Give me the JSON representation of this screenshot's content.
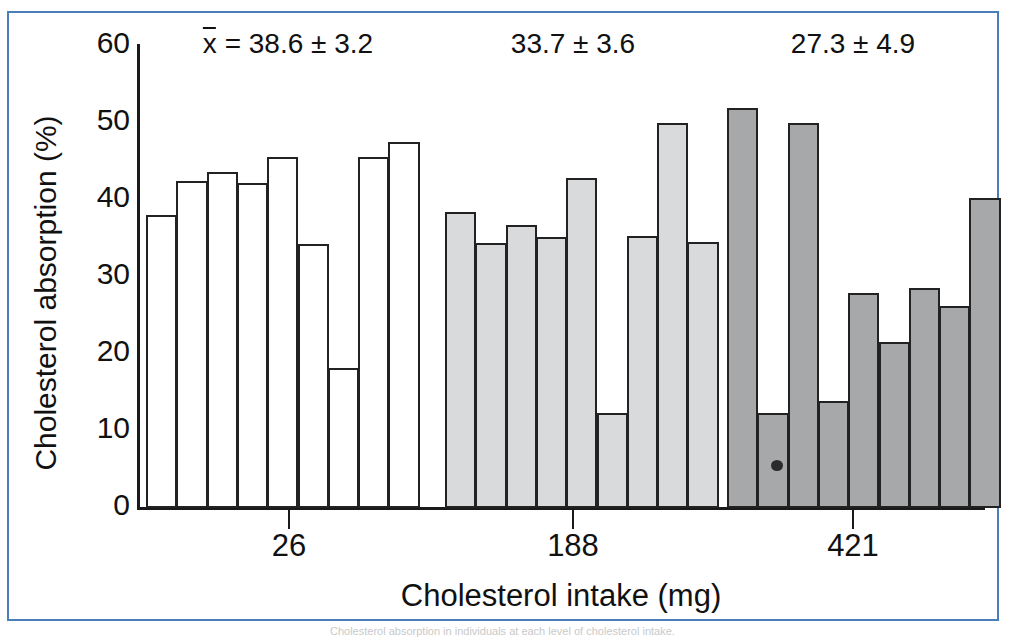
{
  "figure": {
    "frame_color": "#4a7ebb",
    "background": "#ffffff",
    "bleed_text": "Cholesterol absorption in individuals at each level of cholesterol intake."
  },
  "chart_data": {
    "type": "bar",
    "title": "",
    "subtitle": "",
    "xlabel": "Cholesterol intake (mg)",
    "ylabel": "Cholesterol absorption (%)",
    "ylim": [
      0,
      60
    ],
    "yticks": [
      0,
      10,
      20,
      30,
      40,
      50,
      60
    ],
    "ytick_labels": [
      "0",
      "10",
      "20",
      "30",
      "40",
      "50",
      "60"
    ],
    "grid": false,
    "legend": "none",
    "categories": [
      "26",
      "188",
      "421"
    ],
    "xtick_labels": [
      "26",
      "188",
      "421"
    ],
    "annotations": [
      {
        "group": "26",
        "text_prefix": "x",
        "text": " = 38.6 ± 3.2",
        "mean": 38.6,
        "sd": 3.2,
        "overline": true
      },
      {
        "group": "188",
        "text_prefix": "",
        "text": "33.7 ± 3.6",
        "mean": 33.7,
        "sd": 3.6,
        "overline": false
      },
      {
        "group": "421",
        "text_prefix": "",
        "text": "27.3 ± 4.9",
        "mean": 27.3,
        "sd": 4.9,
        "overline": false
      }
    ],
    "groups": [
      {
        "name": "26",
        "label": "26",
        "fill": "#ffffff",
        "edge": "#222222",
        "mean": 38.6,
        "sd": 3.2,
        "values": [
          38.0,
          42.5,
          43.6,
          42.2,
          45.6,
          34.3,
          18.2,
          45.6,
          47.5
        ]
      },
      {
        "name": "188",
        "label": "188",
        "fill": "#d9dadb",
        "edge": "#222222",
        "mean": 33.7,
        "sd": 3.6,
        "values": [
          38.5,
          34.4,
          36.8,
          35.2,
          42.9,
          12.4,
          35.3,
          50.0,
          34.6
        ]
      },
      {
        "name": "421",
        "label": "421",
        "fill": "#a6a8aa",
        "edge": "#222222",
        "mean": 27.3,
        "sd": 4.9,
        "values": [
          51.9,
          12.4,
          50.0,
          13.9,
          27.9,
          21.6,
          28.6,
          26.2,
          40.2
        ]
      }
    ]
  }
}
